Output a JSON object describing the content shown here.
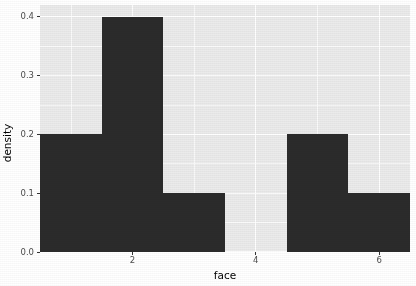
{
  "chart_data": {
    "type": "bar",
    "title": "",
    "subtitle": "",
    "xlabel": "face",
    "ylabel": "density",
    "categories": [
      "1",
      "2",
      "3",
      "4",
      "5",
      "6"
    ],
    "values": [
      0.2,
      0.4,
      0.1,
      0.0,
      0.2,
      0.1
    ],
    "series": [
      {
        "name": "density",
        "values": [
          0.2,
          0.4,
          0.1,
          0.0,
          0.2,
          0.1
        ]
      }
    ],
    "x": [
      1,
      2,
      3,
      4,
      5,
      6
    ],
    "xlim": [
      0.5,
      6.5
    ],
    "ylim": [
      0.0,
      0.42
    ],
    "x_tick_values": [
      2,
      4,
      6
    ],
    "x_tick_labels": [
      "2",
      "4",
      "6"
    ],
    "y_tick_values": [
      0.0,
      0.1,
      0.2,
      0.3,
      0.4
    ],
    "y_tick_labels": [
      "0.0",
      "0.1",
      "0.2",
      "0.3",
      "0.4"
    ],
    "grid": true,
    "grid_major_color": "#ffffff",
    "grid_minor_color": "#ffffff",
    "panel_background": "#ebebeb",
    "bar_color": "#2b2b2b",
    "plot_background": "#ffffff",
    "legend": null,
    "legend_position": "none",
    "annotations": []
  },
  "axis_text_color": "#4d4d4d",
  "axis_title_color": "#000000"
}
